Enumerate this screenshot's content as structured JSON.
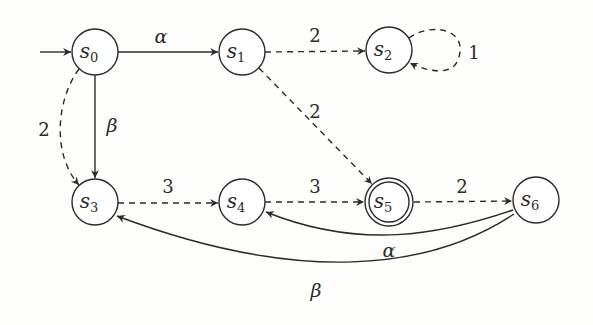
{
  "diagram": {
    "type": "state-transition-graph",
    "initial_state": "s0",
    "nodes": [
      {
        "id": "s0",
        "base": "s",
        "sub": "0",
        "x": 95,
        "y": 52,
        "accepting": false
      },
      {
        "id": "s1",
        "base": "s",
        "sub": "1",
        "x": 242,
        "y": 52,
        "accepting": false
      },
      {
        "id": "s2",
        "base": "s",
        "sub": "2",
        "x": 389,
        "y": 50,
        "accepting": false
      },
      {
        "id": "s3",
        "base": "s",
        "sub": "3",
        "x": 95,
        "y": 202,
        "accepting": false
      },
      {
        "id": "s4",
        "base": "s",
        "sub": "4",
        "x": 242,
        "y": 202,
        "accepting": false
      },
      {
        "id": "s5",
        "base": "s",
        "sub": "5",
        "x": 389,
        "y": 202,
        "accepting": true
      },
      {
        "id": "s6",
        "base": "s",
        "sub": "6",
        "x": 536,
        "y": 200,
        "accepting": false
      }
    ],
    "edges": [
      {
        "from": "init",
        "to": "s0",
        "label": "",
        "style": "solid"
      },
      {
        "from": "s0",
        "to": "s1",
        "label": "α",
        "style": "solid"
      },
      {
        "from": "s0",
        "to": "s3",
        "label": "β",
        "style": "solid"
      },
      {
        "from": "s0",
        "to": "s3",
        "label": "2",
        "style": "dashed"
      },
      {
        "from": "s1",
        "to": "s2",
        "label": "2",
        "style": "dashed"
      },
      {
        "from": "s1",
        "to": "s5",
        "label": "2",
        "style": "dashed"
      },
      {
        "from": "s2",
        "to": "s2",
        "label": "1",
        "style": "dashed"
      },
      {
        "from": "s3",
        "to": "s4",
        "label": "3",
        "style": "dashed"
      },
      {
        "from": "s4",
        "to": "s5",
        "label": "3",
        "style": "dashed"
      },
      {
        "from": "s5",
        "to": "s6",
        "label": "2",
        "style": "dashed"
      },
      {
        "from": "s6",
        "to": "s4",
        "label": "α",
        "style": "solid"
      },
      {
        "from": "s6",
        "to": "s3",
        "label": "β",
        "style": "solid"
      }
    ]
  }
}
